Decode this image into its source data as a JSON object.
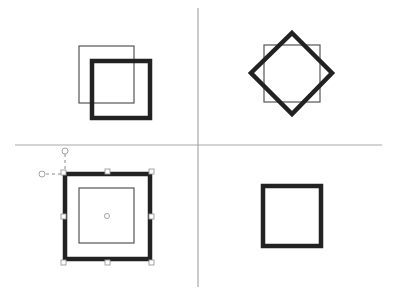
{
  "diagram": {
    "colors": {
      "background": "#ffffff",
      "divider": "#a8a8a8",
      "original_outline": "#555555",
      "transformed_outline": "#222222",
      "handle": "#9a9a9a"
    },
    "panels": [
      {
        "id": "translate",
        "position": "top-left",
        "original": {
          "x": 79,
          "y": 46,
          "w": 55,
          "h": 57
        },
        "result": {
          "x": 92,
          "y": 61,
          "w": 58,
          "h": 57
        }
      },
      {
        "id": "rotate",
        "position": "top-right",
        "original": {
          "x": 264,
          "y": 45,
          "w": 56,
          "h": 57
        },
        "result_rotation_deg": 45
      },
      {
        "id": "scale",
        "position": "bottom-left",
        "original": {
          "x": 79,
          "y": 188,
          "w": 55,
          "h": 55
        },
        "result": {
          "x": 65,
          "y": 174,
          "w": 85,
          "h": 85
        },
        "selection_handles": 8,
        "center_marker": true
      },
      {
        "id": "result",
        "position": "bottom-right",
        "result": {
          "x": 263,
          "y": 186,
          "w": 58,
          "h": 60
        }
      }
    ]
  }
}
